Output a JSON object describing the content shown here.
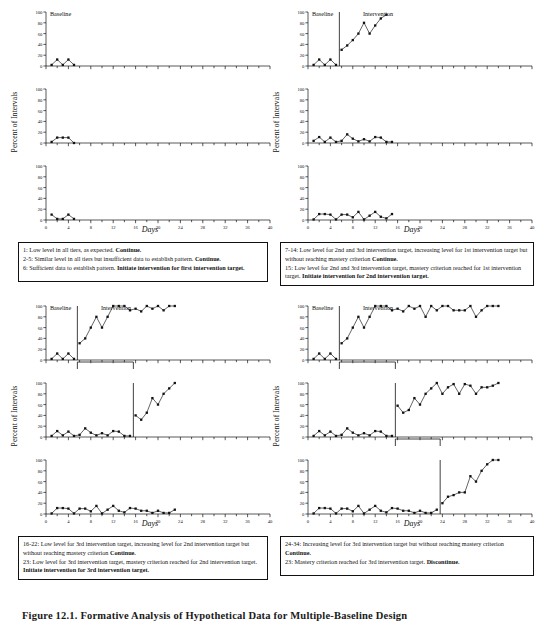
{
  "figure": {
    "caption": "Figure 12.1. Formative Analysis of Hypothetical Data for Multiple-Baseline Design"
  },
  "axes": {
    "ylabel": "Percent of Intervals",
    "xlabel": "Days",
    "ytick_labels": [
      "0",
      "20",
      "40",
      "60",
      "80",
      "100"
    ],
    "ytick_values": [
      0,
      20,
      40,
      60,
      80,
      100
    ],
    "xtick_labels": [
      "0",
      "4",
      "8",
      "12",
      "16",
      "20",
      "24",
      "28",
      "32",
      "36",
      "40"
    ],
    "xtick_values": [
      0,
      4,
      8,
      12,
      16,
      20,
      24,
      28,
      32,
      36,
      40
    ],
    "xlim": [
      0,
      40
    ],
    "ylim": [
      0,
      100
    ],
    "phase_label_baseline": "Baseline",
    "phase_label_intervention": "Intervention"
  },
  "panels": [
    {
      "id": "panel-1",
      "position": "top-left",
      "phase_labels": {
        "baseline": "Baseline",
        "intervention": null
      },
      "caption_lines": [
        {
          "text": "1: Low level in all tiers, as expected. ",
          "bold": "Continue."
        },
        {
          "text": "2-5: Similar level in all tiers but insufficient data to establish pattern. ",
          "bold": "Continue."
        },
        {
          "text": "6: Sufficient data to establish pattern. ",
          "bold": "Initiate intervention for first intervention target."
        }
      ],
      "tiers": [
        {
          "tier": 1,
          "phase_line_day": null,
          "baseline": {
            "x": [
              1,
              2,
              3,
              4,
              5
            ],
            "y": [
              2,
              12,
              2,
              12,
              2
            ]
          },
          "intervention": {
            "x": [],
            "y": []
          }
        },
        {
          "tier": 2,
          "phase_line_day": null,
          "baseline": {
            "x": [
              1,
              2,
              3,
              4,
              5
            ],
            "y": [
              2,
              10,
              10,
              10,
              0
            ]
          },
          "intervention": {
            "x": [],
            "y": []
          }
        },
        {
          "tier": 3,
          "phase_line_day": null,
          "baseline": {
            "x": [
              1,
              2,
              3,
              4,
              5
            ],
            "y": [
              10,
              2,
              2,
              10,
              2
            ]
          },
          "intervention": {
            "x": [],
            "y": []
          }
        }
      ]
    },
    {
      "id": "panel-2",
      "position": "top-right",
      "phase_labels": {
        "baseline": "Baseline",
        "intervention": "Intervention"
      },
      "caption_lines": [
        {
          "text": "7-14: Low level for 2nd and 3rd intervention target, increasing level for 1st intervention target  but without reaching mastery criterion ",
          "bold": "Continue."
        },
        {
          "text": "15: Low level for 2nd and 3rd intervention target, mastery criterion reached for 1st intervention target. ",
          "bold": "Initiate intervention for 2nd intervention target."
        }
      ],
      "tiers": [
        {
          "tier": 1,
          "phase_line_day": 5.6,
          "baseline": {
            "x": [
              1,
              2,
              3,
              4,
              5
            ],
            "y": [
              2,
              12,
              2,
              12,
              2
            ]
          },
          "intervention": {
            "x": [
              6,
              7,
              8,
              9,
              10,
              11,
              12,
              13,
              14
            ],
            "y": [
              30,
              38,
              48,
              60,
              80,
              60,
              75,
              88,
              95
            ]
          }
        },
        {
          "tier": 2,
          "phase_line_day": null,
          "baseline": {
            "x": [
              1,
              2,
              3,
              4,
              5,
              6,
              7,
              8,
              9,
              10,
              11,
              12,
              13,
              14,
              15
            ],
            "y": [
              4,
              11,
              2,
              10,
              2,
              4,
              16,
              8,
              3,
              7,
              3,
              11,
              10,
              2,
              2
            ]
          },
          "intervention": {
            "x": [],
            "y": []
          }
        },
        {
          "tier": 3,
          "phase_line_day": null,
          "baseline": {
            "x": [
              1,
              2,
              3,
              4,
              5,
              6,
              7,
              8,
              9,
              10,
              11,
              12,
              13,
              14,
              15
            ],
            "y": [
              1,
              11,
              11,
              10,
              1,
              10,
              10,
              5,
              15,
              1,
              8,
              15,
              6,
              3,
              11
            ]
          },
          "intervention": {
            "x": [],
            "y": []
          }
        }
      ]
    },
    {
      "id": "panel-3",
      "position": "bottom-left",
      "phase_labels": {
        "baseline": "Baseline",
        "intervention": "Intervention"
      },
      "caption_lines": [
        {
          "text": "16-22: Low level for 3rd intervention target, increasing level for 2nd intervention target  but without reaching mastery criterion ",
          "bold": "Continue."
        },
        {
          "text": "23: Low level for 3rd intervention target, mastery criterion reached for 2nd intervention target. ",
          "bold": "Initiate intervention for 3rd intervention target."
        }
      ],
      "tiers": [
        {
          "tier": 1,
          "phase_line_day": 5.6,
          "baseline": {
            "x": [
              1,
              2,
              3,
              4,
              5
            ],
            "y": [
              2,
              12,
              2,
              12,
              2
            ]
          },
          "intervention": {
            "x": [
              6,
              7,
              8,
              9,
              10,
              11,
              12,
              13,
              14,
              15,
              16,
              17,
              18,
              19,
              20,
              21,
              22,
              23
            ],
            "y": [
              31,
              40,
              60,
              80,
              60,
              80,
              100,
              100,
              100,
              92,
              95,
              90,
              100,
              95,
              100,
              92,
              100,
              100
            ]
          }
        },
        {
          "tier": 2,
          "phase_line_day": 15.6,
          "baseline": {
            "x": [
              1,
              2,
              3,
              4,
              5,
              6,
              7,
              8,
              9,
              10,
              11,
              12,
              13,
              14,
              15
            ],
            "y": [
              2,
              11,
              3,
              10,
              2,
              4,
              16,
              8,
              3,
              7,
              3,
              11,
              10,
              2,
              2
            ]
          },
          "intervention": {
            "x": [
              16,
              17,
              18,
              19,
              20,
              21,
              22,
              23
            ],
            "y": [
              40,
              32,
              45,
              72,
              60,
              80,
              90,
              100
            ]
          }
        },
        {
          "tier": 3,
          "phase_line_day": null,
          "baseline": {
            "x": [
              1,
              2,
              3,
              4,
              5,
              6,
              7,
              8,
              9,
              10,
              11,
              12,
              13,
              14,
              15,
              16,
              17,
              18,
              19,
              20,
              21,
              22,
              23
            ],
            "y": [
              1,
              11,
              11,
              10,
              1,
              10,
              10,
              5,
              15,
              1,
              8,
              15,
              6,
              3,
              11,
              10,
              6,
              6,
              2,
              6,
              2,
              2,
              8
            ]
          },
          "intervention": {
            "x": [],
            "y": []
          }
        }
      ]
    },
    {
      "id": "panel-4",
      "position": "bottom-right",
      "phase_labels": {
        "baseline": "Baseline",
        "intervention": "Intervention"
      },
      "caption_lines": [
        {
          "text": "24-34: Increasing level for 3rd intervention target  but without reaching mastery criterion ",
          "bold": "Continue."
        },
        {
          "text": "23: Mastery criterion reached for 3rd intervention target. ",
          "bold": "Discontinue."
        }
      ],
      "tiers": [
        {
          "tier": 1,
          "phase_line_day": 5.6,
          "baseline": {
            "x": [
              1,
              2,
              3,
              4,
              5
            ],
            "y": [
              2,
              12,
              2,
              12,
              2
            ]
          },
          "intervention": {
            "x": [
              6,
              7,
              8,
              9,
              10,
              11,
              12,
              13,
              14,
              15,
              16,
              17,
              18,
              19,
              20,
              21,
              22,
              23,
              24,
              25,
              26,
              27,
              28,
              29,
              30,
              31,
              32,
              33,
              34
            ],
            "y": [
              31,
              40,
              60,
              80,
              60,
              80,
              100,
              100,
              100,
              92,
              95,
              90,
              100,
              95,
              100,
              80,
              100,
              92,
              100,
              100,
              92,
              92,
              92,
              100,
              80,
              92,
              100,
              100,
              100
            ]
          }
        },
        {
          "tier": 2,
          "phase_line_day": 15.6,
          "baseline": {
            "x": [
              1,
              2,
              3,
              4,
              5,
              6,
              7,
              8,
              9,
              10,
              11,
              12,
              13,
              14,
              15
            ],
            "y": [
              2,
              11,
              3,
              10,
              2,
              4,
              16,
              8,
              3,
              7,
              3,
              11,
              10,
              2,
              2
            ]
          },
          "intervention": {
            "x": [
              16,
              17,
              18,
              19,
              20,
              21,
              22,
              23,
              24,
              25,
              26,
              27,
              28,
              29,
              30,
              31,
              32,
              33,
              34
            ],
            "y": [
              58,
              45,
              50,
              72,
              60,
              80,
              90,
              100,
              80,
              92,
              98,
              80,
              98,
              95,
              80,
              92,
              92,
              95,
              100
            ]
          }
        },
        {
          "tier": 3,
          "phase_line_day": 23.6,
          "baseline": {
            "x": [
              1,
              2,
              3,
              4,
              5,
              6,
              7,
              8,
              9,
              10,
              11,
              12,
              13,
              14,
              15,
              16,
              17,
              18,
              19,
              20,
              21,
              22,
              23
            ],
            "y": [
              1,
              11,
              11,
              10,
              1,
              10,
              10,
              5,
              15,
              1,
              8,
              15,
              6,
              3,
              11,
              10,
              6,
              6,
              2,
              6,
              2,
              2,
              8
            ]
          },
          "intervention": {
            "x": [
              24,
              25,
              26,
              27,
              28,
              29,
              30,
              31,
              32,
              33,
              34
            ],
            "y": [
              20,
              32,
              35,
              40,
              40,
              70,
              60,
              80,
              92,
              100,
              100
            ]
          }
        }
      ]
    }
  ]
}
